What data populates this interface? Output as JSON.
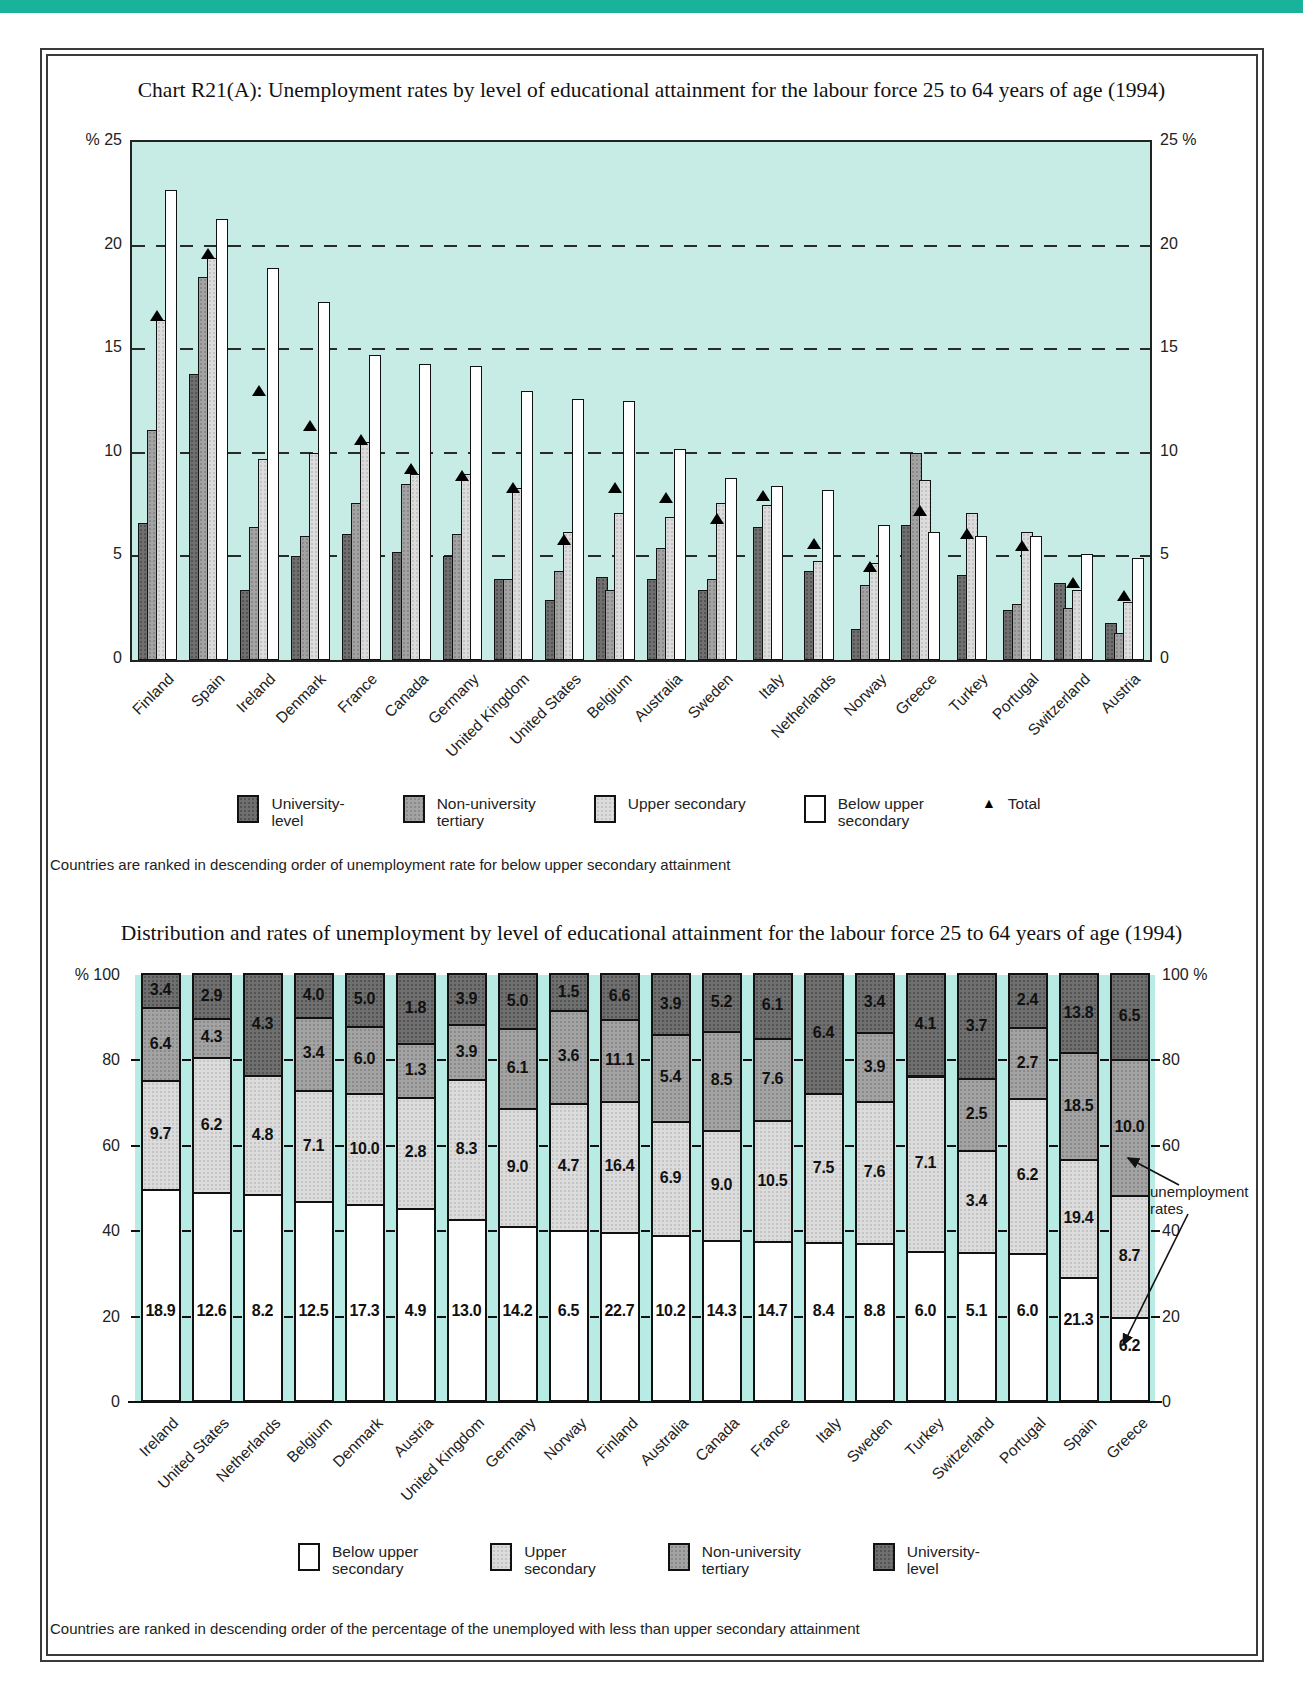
{
  "header_bar": {
    "color": "#19b29b"
  },
  "colors": {
    "university": "#6f6f6f",
    "non_university": "#a3a3a3",
    "upper_secondary": "#dcdcdc",
    "below_upper": "#ffffff",
    "plot1_background": "#c7ece6",
    "plot2_gap": "#b8ebe4",
    "total_marker": "#000000"
  },
  "chart1": {
    "title": "Chart R21(A): Unemployment rates by level of educational attainment for the labour force 25 to 64 years of age (1994)",
    "axis_left_top": "% 25",
    "axis_right_top": "25 %",
    "legend": [
      {
        "name": "university",
        "label": "University-\nlevel"
      },
      {
        "name": "non_university",
        "label": "Non-university\ntertiary"
      },
      {
        "name": "upper_secondary",
        "label": "Upper secondary"
      },
      {
        "name": "below_upper",
        "label": "Below upper\nsecondary"
      },
      {
        "name": "total",
        "label": "Total",
        "marker": "▲"
      }
    ],
    "footnote": "Countries are ranked in descending order of unemployment rate for below upper secondary attainment"
  },
  "chart2": {
    "title": "Distribution and rates of unemployment by level of educational attainment for the labour force 25 to 64 years of age (1994)",
    "axis_left_top": "% 100",
    "axis_right_top": "100 %",
    "annotation": "unemployment rates",
    "legend": [
      {
        "name": "below_upper",
        "label": "Below upper\nsecondary"
      },
      {
        "name": "upper_secondary",
        "label": "Upper\nsecondary"
      },
      {
        "name": "non_university",
        "label": "Non-university\ntertiary"
      },
      {
        "name": "university",
        "label": "University-\nlevel"
      }
    ],
    "footnote": "Countries are ranked in descending order of the percentage of the unemployed with less than upper secondary attainment"
  },
  "chart_data": [
    {
      "type": "bar",
      "title": "Chart R21(A): Unemployment rates by level of educational attainment for the labour force 25 to 64 years of age (1994)",
      "ylabel": "%",
      "ylim": [
        0,
        25
      ],
      "yticks": [
        25,
        20,
        15,
        10,
        5,
        0
      ],
      "gridlines": [
        20,
        15,
        10,
        5
      ],
      "legend_position": "bottom",
      "categories": [
        "Finland",
        "Spain",
        "Ireland",
        "Denmark",
        "France",
        "Canada",
        "Germany",
        "United Kingdom",
        "United States",
        "Belgium",
        "Australia",
        "Sweden",
        "Italy",
        "Netherlands",
        "Norway",
        "Greece",
        "Turkey",
        "Portugal",
        "Switzerland",
        "Austria"
      ],
      "series": [
        {
          "name": "University-level",
          "values": [
            6.6,
            13.8,
            3.4,
            5.0,
            6.1,
            5.2,
            5.0,
            3.9,
            2.9,
            4.0,
            3.9,
            3.4,
            6.4,
            4.3,
            1.5,
            6.5,
            4.1,
            2.4,
            3.7,
            1.8
          ]
        },
        {
          "name": "Non-university tertiary",
          "values": [
            11.1,
            18.5,
            6.4,
            6.0,
            7.6,
            8.5,
            6.1,
            3.9,
            4.3,
            3.4,
            5.4,
            3.9,
            null,
            null,
            3.6,
            10.0,
            null,
            2.7,
            2.5,
            1.3
          ]
        },
        {
          "name": "Upper secondary",
          "values": [
            16.4,
            19.4,
            9.7,
            10.0,
            10.5,
            9.0,
            9.0,
            8.3,
            6.2,
            7.1,
            6.9,
            7.6,
            7.5,
            4.8,
            4.7,
            8.7,
            7.1,
            6.2,
            3.4,
            2.8
          ]
        },
        {
          "name": "Below upper secondary",
          "values": [
            22.7,
            21.3,
            18.9,
            17.3,
            14.7,
            14.3,
            14.2,
            13.0,
            12.6,
            12.5,
            10.2,
            8.8,
            8.4,
            8.2,
            6.5,
            6.2,
            6.0,
            6.0,
            5.1,
            4.9
          ]
        },
        {
          "name": "Total (triangle marker, estimated)",
          "values": [
            16.6,
            19.6,
            13.0,
            11.3,
            10.6,
            9.2,
            8.9,
            8.3,
            5.8,
            8.3,
            7.8,
            6.8,
            7.9,
            5.6,
            4.5,
            7.2,
            6.1,
            5.5,
            3.7,
            3.1
          ]
        }
      ]
    },
    {
      "type": "stacked-bar-100",
      "title": "Distribution and rates of unemployment by level of educational attainment for the labour force 25 to 64 years of age (1994)",
      "ylim": [
        0,
        100
      ],
      "yticks": [
        100,
        80,
        60,
        40,
        20,
        0
      ],
      "categories": [
        "Ireland",
        "United States",
        "Netherlands",
        "Belgium",
        "Denmark",
        "Austria",
        "United Kingdom",
        "Germany",
        "Norway",
        "Finland",
        "Australia",
        "Canada",
        "France",
        "Italy",
        "Sweden",
        "Turkey",
        "Switzerland",
        "Portugal",
        "Spain",
        "Greece"
      ],
      "series": [
        {
          "name": "Below upper secondary",
          "shares_estimated": [
            49.5,
            48.6,
            48.2,
            46.5,
            45.8,
            45.0,
            42.5,
            40.7,
            39.8,
            39.4,
            38.6,
            37.5,
            37.2,
            37.0,
            36.8,
            35.0,
            34.7,
            34.5,
            28.8,
            19.5
          ],
          "rate_labels": [
            18.9,
            12.6,
            8.2,
            12.5,
            17.3,
            4.9,
            13.0,
            14.2,
            6.5,
            22.7,
            10.2,
            14.3,
            14.7,
            8.4,
            8.8,
            6.0,
            5.1,
            6.0,
            21.3,
            6.2
          ]
        },
        {
          "name": "Upper secondary",
          "shares_estimated": [
            25.4,
            31.8,
            27.8,
            26.1,
            26.1,
            26.0,
            32.6,
            27.7,
            29.8,
            30.6,
            26.8,
            25.8,
            28.4,
            34.9,
            33.2,
            41.0,
            23.8,
            36.2,
            27.6,
            28.6
          ],
          "rate_labels": [
            9.7,
            6.2,
            4.8,
            7.1,
            10.0,
            2.8,
            8.3,
            9.0,
            4.7,
            16.4,
            6.9,
            9.0,
            10.5,
            7.5,
            7.6,
            7.1,
            3.4,
            6.2,
            19.4,
            8.7
          ]
        },
        {
          "name": "Non-university tertiary",
          "shares_estimated": [
            17.1,
            9.0,
            0,
            17.1,
            15.7,
            12.7,
            12.9,
            18.7,
            21.7,
            19.2,
            20.3,
            23.1,
            19.2,
            0,
            16.2,
            0,
            16.9,
            16.6,
            25.1,
            31.8
          ],
          "rate_labels": [
            6.4,
            4.3,
            null,
            3.4,
            6.0,
            1.3,
            3.9,
            6.1,
            3.6,
            11.1,
            5.4,
            8.5,
            7.6,
            null,
            3.9,
            null,
            2.5,
            2.7,
            18.5,
            10.0
          ]
        },
        {
          "name": "University-level",
          "shares_estimated": [
            8.0,
            10.6,
            24.0,
            10.3,
            12.4,
            16.3,
            12.0,
            12.9,
            8.7,
            10.8,
            14.3,
            13.6,
            15.2,
            28.1,
            13.8,
            24.0,
            24.6,
            12.7,
            18.5,
            20.1
          ],
          "rate_labels": [
            3.4,
            2.9,
            4.3,
            4.0,
            5.0,
            1.8,
            3.9,
            5.0,
            1.5,
            6.6,
            3.9,
            5.2,
            6.1,
            6.4,
            3.4,
            4.1,
            3.7,
            2.4,
            13.8,
            6.5
          ]
        }
      ]
    }
  ]
}
